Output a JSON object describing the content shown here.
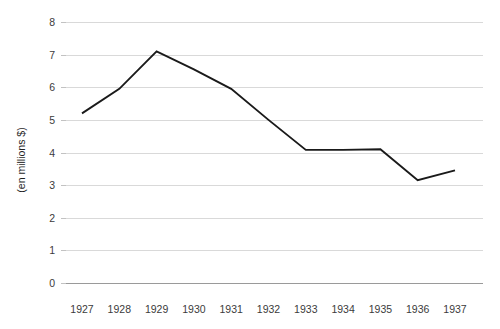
{
  "chart_data": {
    "type": "line",
    "title": "",
    "subtitle": "",
    "xlabel": "",
    "ylabel": "(en millions $)",
    "categories": [
      "1927",
      "1928",
      "1929",
      "1930",
      "1931",
      "1932",
      "1933",
      "1934",
      "1935",
      "1936",
      "1937"
    ],
    "x": [
      1927,
      1928,
      1929,
      1930,
      1931,
      1932,
      1933,
      1934,
      1935,
      1936,
      1937
    ],
    "values": [
      5.2,
      5.95,
      7.1,
      6.55,
      5.95,
      5.0,
      4.08,
      4.08,
      4.1,
      3.15,
      3.45
    ],
    "series": [
      {
        "name": "",
        "values": [
          5.2,
          5.95,
          7.1,
          6.55,
          5.95,
          5.0,
          4.08,
          4.08,
          4.1,
          3.15,
          3.45
        ],
        "color": "#1a1a1a"
      }
    ],
    "ylim": [
      0,
      8
    ],
    "yticks": [
      0,
      1,
      2,
      3,
      4,
      5,
      6,
      7,
      8
    ],
    "ytick_labels": [
      "0",
      "1",
      "2",
      "3",
      "4",
      "5",
      "6",
      "7",
      "8"
    ],
    "xtick_labels": [
      "1927",
      "1928",
      "1929",
      "1930",
      "1931",
      "1932",
      "1933",
      "1934",
      "1935",
      "1936",
      "1937"
    ],
    "grid": {
      "horizontal": true,
      "vertical": false,
      "color": "#d9d9d9"
    },
    "legend": {
      "visible": false,
      "position": "none",
      "entries": []
    },
    "annotations": [],
    "background_color": "#ffffff",
    "axis_color": "#9a9a9a"
  },
  "axes": {
    "y_axis_title": "(en millions $)"
  }
}
